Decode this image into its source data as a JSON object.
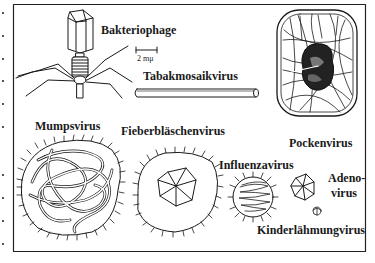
{
  "figure": {
    "labels": {
      "bacteriophage": "Bakteriophage",
      "scale": "2 mμ",
      "tobacco_mosaic": "Tabakmosaikvirus",
      "pox": "Pockenvirus",
      "mumps": "Mumpsvirus",
      "fever_blister": "Fieberbläschenvirus",
      "influenza": "Influenzavirus",
      "adeno_line1": "Adeno-",
      "adeno_line2": "virus",
      "polio": "Kinderlähmungvirus"
    },
    "colors": {
      "ink": "#1a1a1a",
      "background": "#ffffff",
      "frame": "#222222"
    }
  }
}
